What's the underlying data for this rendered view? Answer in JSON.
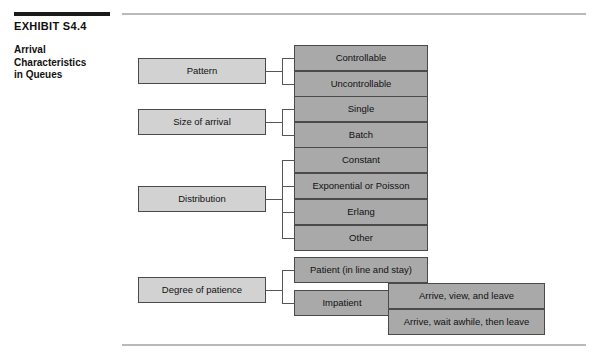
{
  "exhibit": {
    "number": "EXHIBIT S4.4",
    "title_lines": [
      "Arrival",
      "Characteristics",
      "in Queues"
    ],
    "title": "Arrival Characteristics in Queues"
  },
  "colors": {
    "level1_fill": "#d2d2d2",
    "level2_fill": "#a9a9a9",
    "box_border": "#4a4a4a",
    "connector": "#555555",
    "title_rule": "#1a1a1a",
    "page_rule": "#b9b9b9"
  },
  "diagram": {
    "type": "tree",
    "root_label": "Arrival Characteristics in Queues",
    "branches": [
      {
        "label": "Pattern",
        "children": [
          {
            "label": "Controllable"
          },
          {
            "label": "Uncontrollable"
          }
        ]
      },
      {
        "label": "Size of arrival",
        "children": [
          {
            "label": "Single"
          },
          {
            "label": "Batch"
          }
        ]
      },
      {
        "label": "Distribution",
        "children": [
          {
            "label": "Constant"
          },
          {
            "label": "Exponential or Poisson"
          },
          {
            "label": "Erlang"
          },
          {
            "label": "Other"
          }
        ]
      },
      {
        "label": "Degree of patience",
        "children": [
          {
            "label": "Patient (in line and stay)"
          },
          {
            "label": "Impatient",
            "children": [
              {
                "label": "Arrive, view, and leave"
              },
              {
                "label": "Arrive, wait awhile, then leave"
              }
            ]
          }
        ]
      }
    ]
  }
}
